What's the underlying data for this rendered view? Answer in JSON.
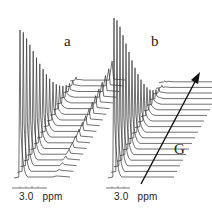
{
  "chart_data": [
    {
      "type": "line",
      "title": "a",
      "description": "Stacked NMR spectra (pseudo-2D diffusion stack); peak at ~3.0 ppm decays with increasing gradient G; a second component on the right grows/persists",
      "xlabel": "ppm",
      "x_tick_labels": [
        "3.0"
      ],
      "n_traces": 18,
      "main_peak_heights": [
        148,
        140,
        128,
        116,
        104,
        92,
        80,
        69,
        58,
        48,
        39,
        31,
        24,
        18,
        13,
        9,
        6,
        4
      ],
      "secondary_peak_heights": [
        2,
        3,
        4,
        5,
        6,
        7,
        8,
        9,
        10,
        11,
        12,
        13,
        14,
        15,
        16,
        17,
        18,
        20
      ],
      "offset_direction": "diagonal up-right with increasing G"
    },
    {
      "type": "line",
      "title": "b",
      "description": "Stacked NMR spectra; peak at ~3.0 ppm decays with increasing gradient G; right side flat baseline",
      "xlabel": "ppm",
      "x_tick_labels": [
        "3.0"
      ],
      "n_traces": 18,
      "main_peak_heights": [
        160,
        152,
        140,
        126,
        112,
        98,
        84,
        71,
        59,
        48,
        38,
        29,
        21,
        15,
        10,
        6,
        3,
        2
      ],
      "secondary_peak_heights": [
        0,
        0,
        0,
        0,
        0,
        0,
        0,
        0,
        0,
        0,
        0,
        0,
        0,
        0,
        0,
        0,
        0,
        0
      ],
      "offset_direction": "diagonal up-right with increasing G"
    }
  ],
  "labels": {
    "panel_a": "a",
    "panel_b": "b",
    "axis_a": "3.0   ppm",
    "axis_b": "3.0   ppm",
    "gradient": "G"
  },
  "colors": {
    "trace": "#333333",
    "text": "#222222"
  }
}
